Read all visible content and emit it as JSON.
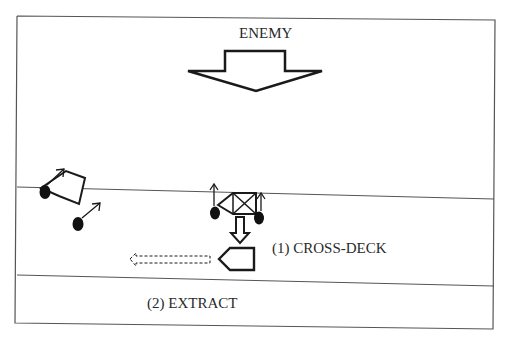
{
  "diagram": {
    "type": "tactical-maneuver-sketch",
    "labels": {
      "enemy": "ENEMY",
      "step1": "(1) CROSS-DECK",
      "step2": "(2) EXTRACT"
    },
    "elements": {
      "enemy_direction_arrow": "large hollow arrow pointing down (enemy threat axis)",
      "road_lines": 2,
      "disabled_vehicle": "pentagon vehicle off-road left, tracks/wheels with outward arrows",
      "recovery_vehicle": "vehicle with X box (disabled) on road edge, wheels with up arrows",
      "transfer_arrow": "hollow arrow pointing down from disabled vehicle to receiving vehicle",
      "receiving_vehicle": "pentagon vehicle pointing left",
      "extract_arrow": "dashed hollow arrow pointing left"
    },
    "colors": {
      "stroke": "#1a1a1a",
      "frame": "#555555",
      "text": "#2a2a2a",
      "background": "#ffffff"
    }
  }
}
